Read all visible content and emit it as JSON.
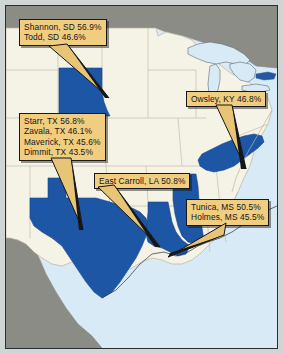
{
  "image": {
    "type": "choropleth-map",
    "region": "United States (south-central and eastern)",
    "description": "U.S. map with selected states shaded dark blue and five gold callout boxes listing counties and percentage values"
  },
  "colors": {
    "highlight_state": "#1d56a5",
    "land": "#f5f2e6",
    "water": "#d8eaf5",
    "foreign_land": "#8c8c87",
    "callout_fill": "#f0cd7f",
    "callout_border": "#16181c",
    "frame": "#cfd4d4"
  },
  "highlighted_states": [
    {
      "name": "South Dakota",
      "abbr": "SD"
    },
    {
      "name": "Texas",
      "abbr": "TX"
    },
    {
      "name": "Louisiana",
      "abbr": "LA"
    },
    {
      "name": "Mississippi",
      "abbr": "MS"
    },
    {
      "name": "Kentucky",
      "abbr": "KY"
    }
  ],
  "callouts": [
    {
      "id": "south-dakota",
      "entries": [
        {
          "label": "Shannon, SD",
          "value": "56.9%"
        },
        {
          "label": "Todd, SD",
          "value": "46.6%"
        }
      ],
      "lines": [
        "Shannon, SD  56.9%",
        "Todd, SD  46.6%"
      ]
    },
    {
      "id": "texas",
      "entries": [
        {
          "label": "Starr, TX",
          "value": "56.8%"
        },
        {
          "label": "Zavala, TX",
          "value": "46.1%"
        },
        {
          "label": "Maverick, TX",
          "value": "45.6%"
        },
        {
          "label": "Dimmit, TX",
          "value": "43.5%"
        }
      ],
      "lines": [
        "Starr, TX  56.8%",
        "Zavala, TX  46.1%",
        "Maverick, TX  45.6%",
        "Dimmit, TX  43.5%"
      ]
    },
    {
      "id": "kentucky",
      "entries": [
        {
          "label": "Owsley, KY",
          "value": "46.8%"
        }
      ],
      "lines": [
        "Owsley, KY  46.8%"
      ]
    },
    {
      "id": "louisiana",
      "entries": [
        {
          "label": "East Carroll, LA",
          "value": "50.8%"
        }
      ],
      "lines": [
        "East Carroll, LA  50.8%"
      ]
    },
    {
      "id": "mississippi",
      "entries": [
        {
          "label": "Tunica, MS",
          "value": "50.5%"
        },
        {
          "label": "Holmes, MS",
          "value": "45.5%"
        }
      ],
      "lines": [
        "Tunica, MS  50.5%",
        "Holmes, MS  45.5%"
      ]
    }
  ]
}
